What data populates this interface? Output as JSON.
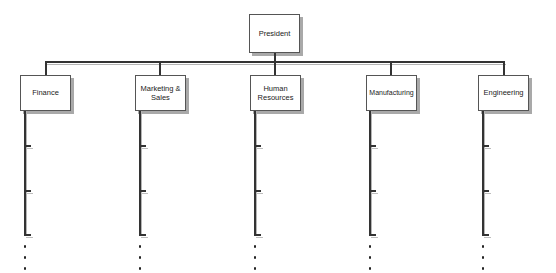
{
  "chart": {
    "type": "org-chart",
    "root": {
      "label": "President"
    },
    "departments": [
      {
        "label": "Finance"
      },
      {
        "label": "Marketing & Sales"
      },
      {
        "label": "Human Resources"
      },
      {
        "label": "Manufacturing"
      },
      {
        "label": "Engineering"
      }
    ],
    "subordinate_ticks_per_department": 3,
    "continuation": "..."
  },
  "colors": {
    "line": "#333333",
    "shadow": "#a9a9a9",
    "box_fill": "#ffffff"
  }
}
